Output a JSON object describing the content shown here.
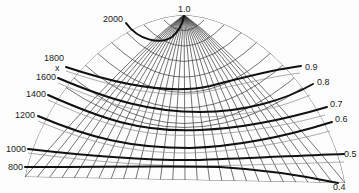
{
  "figure": {
    "pole_label": "1.0",
    "marker": "x",
    "left_labels": [
      {
        "text": "2000",
        "x": 103,
        "y": 22
      },
      {
        "text": "1800",
        "x": 44,
        "y": 61
      },
      {
        "text": "1600",
        "x": 36,
        "y": 80
      },
      {
        "text": "1400",
        "x": 26,
        "y": 97
      },
      {
        "text": "1200",
        "x": 15,
        "y": 118
      },
      {
        "text": "1000",
        "x": 6,
        "y": 152
      },
      {
        "text": "800",
        "x": 8,
        "y": 170
      }
    ],
    "right_labels": [
      {
        "text": "0.9",
        "x": 305,
        "y": 70
      },
      {
        "text": "0.8",
        "x": 317,
        "y": 85
      },
      {
        "text": "0.7",
        "x": 330,
        "y": 107
      },
      {
        "text": "0.6",
        "x": 335,
        "y": 122
      },
      {
        "text": "0.5",
        "x": 344,
        "y": 157
      },
      {
        "text": "0.4",
        "x": 333,
        "y": 190
      }
    ],
    "bold_curves": [
      {
        "name": "contour-2000",
        "d": "M126,23 C138,40 160,45 172,37 C180,30 183,22 184,16"
      },
      {
        "name": "contour-1800-to-0.9",
        "d": "M66,67 C120,85 170,95 210,86 C250,76 270,70 301,66"
      },
      {
        "name": "contour-1600-to-0.8",
        "d": "M58,78 C110,100 150,112 200,112 C245,112 285,100 313,84"
      },
      {
        "name": "contour-1400-to-0.7",
        "d": "M48,95 C100,118 140,133 200,130 C250,128 300,115 327,107"
      },
      {
        "name": "contour-1200-to-0.6",
        "d": "M38,116 C90,138 130,148 190,148 C250,146 300,132 332,122"
      },
      {
        "name": "contour-1000-to-0.5",
        "d": "M28,149 C80,155 140,161 200,160 C260,158 310,155 344,154"
      },
      {
        "name": "contour-800-to-0.4",
        "d": "M25,167 C100,167 170,166 220,167 C270,170 305,176 338,183"
      }
    ],
    "thin_curves": [
      {
        "d": "M66,71 C120,89 170,100 210,91 C250,82 275,76 300,73"
      },
      {
        "d": "M58,83 C110,105 150,117 200,117 C245,117 285,106 310,95"
      },
      {
        "d": "M48,100 C100,123 140,138 200,135 C250,133 300,122 325,115"
      },
      {
        "d": "M38,121 C90,143 130,153 190,153 C250,151 300,139 330,131"
      },
      {
        "d": "M28,153 C80,160 140,166 200,166 C260,165 310,163 344,162"
      }
    ]
  }
}
